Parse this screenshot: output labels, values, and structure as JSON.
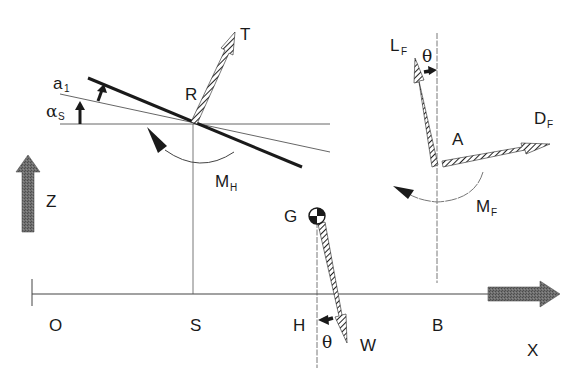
{
  "diagram": {
    "axes": {
      "horizontal_label": "X",
      "vertical_label": "Z",
      "origin_label": "O"
    },
    "points": {
      "origin": "O",
      "s_point": "S",
      "h_point": "H",
      "b_point": "B",
      "r_point": "R",
      "a_point": "A",
      "g_point": "G"
    },
    "forces": {
      "thrust": "T",
      "weight": "W",
      "lift": {
        "main": "L",
        "sub": "F"
      },
      "drag": {
        "main": "D",
        "sub": "F"
      }
    },
    "moments": {
      "hull": {
        "main": "M",
        "sub": "H"
      },
      "foil": {
        "main": "M",
        "sub": "F"
      }
    },
    "angles": {
      "theta_top": "θ",
      "theta_bottom": "θ",
      "alpha": {
        "main": "α",
        "sub": "S"
      },
      "a1": {
        "main": "a",
        "sub": "1"
      }
    },
    "colors": {
      "line": "#1a1a1a",
      "axis_arrow": "#6a6a6a",
      "thin_line": "#555555"
    }
  }
}
